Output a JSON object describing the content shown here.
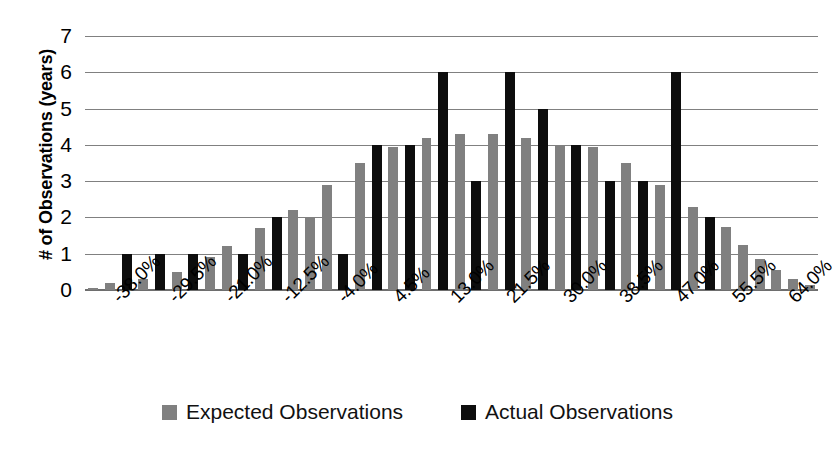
{
  "chart_data": {
    "type": "bar",
    "title": "",
    "subtitle": "",
    "xlabel": "",
    "ylabel": "# of Observations (years)",
    "ylim": [
      0,
      7
    ],
    "yticks": [
      7,
      6,
      5,
      4,
      3,
      2,
      1,
      0
    ],
    "grid": true,
    "legend_position": "bottom-center",
    "axis_tick_labels": [
      "-38.0%",
      "-29.5%",
      "-21.0%",
      "-12.5%",
      "-4.0%",
      "4.5%",
      "13.0%",
      "21.5%",
      "30.0%",
      "38.5%",
      "47.0%",
      "55.5%",
      "64.0%"
    ],
    "categories": [
      "-38.0%",
      "-35.0%",
      "-32.0%",
      "-29.5%",
      "-26.5%",
      "-24.0%",
      "-21.0%",
      "-18.0%",
      "-15.5%",
      "-12.5%",
      "-9.5%",
      "-7.0%",
      "-4.0%",
      "-1.0%",
      "1.5%",
      "4.5%",
      "7.5%",
      "10.0%",
      "13.0%",
      "16.0%",
      "18.5%",
      "21.5%",
      "24.5%",
      "27.0%",
      "30.0%",
      "33.0%",
      "35.5%",
      "38.5%",
      "41.5%",
      "44.0%",
      "47.0%",
      "50.0%",
      "52.5%",
      "55.5%",
      "58.5%",
      "61.0%",
      "64.0%"
    ],
    "series": [
      {
        "name": "Expected Observations",
        "color": "#808080",
        "values": [
          0.05,
          0.2,
          0.3,
          0.5,
          0.9,
          0.9,
          0.9,
          1.2,
          1.7,
          2.2,
          2.9,
          3.5,
          3.95,
          4.2,
          4.3,
          4.2,
          4.0,
          3.95,
          3.5,
          2.9,
          2.3,
          1.75,
          1.25,
          0.85,
          0.55,
          0.3,
          0.15,
          0.05,
          0,
          0,
          0,
          0,
          0,
          0,
          0,
          0,
          0
        ]
      },
      {
        "name": "Actual Observations",
        "color": "#0d0d0d",
        "values": [
          0,
          1,
          1,
          1,
          0,
          0,
          0,
          1,
          2,
          1,
          4,
          4,
          6,
          2,
          6,
          4,
          5,
          4,
          3,
          3,
          6,
          2,
          0,
          0,
          0,
          0,
          0,
          0,
          0,
          0,
          0,
          0,
          0,
          0,
          0,
          0,
          0
        ]
      }
    ],
    "bars": [
      {
        "expected": 0.05,
        "actual": 0
      },
      {
        "expected": 0.2,
        "actual": 0
      },
      {
        "expected": 0,
        "actual": 1
      },
      {
        "expected": 0.3,
        "actual": 0
      },
      {
        "expected": 0,
        "actual": 1
      },
      {
        "expected": 0.5,
        "actual": 0
      },
      {
        "expected": 0,
        "actual": 1
      },
      {
        "expected": 0.9,
        "actual": 0
      },
      {
        "expected": 1.2,
        "actual": 0
      },
      {
        "expected": 0,
        "actual": 1
      },
      {
        "expected": 1.7,
        "actual": 0
      },
      {
        "expected": 0,
        "actual": 2
      },
      {
        "expected": 2.2,
        "actual": 0
      },
      {
        "expected": 2.0,
        "actual": 0
      },
      {
        "expected": 2.9,
        "actual": 0
      },
      {
        "expected": 0,
        "actual": 1
      },
      {
        "expected": 3.5,
        "actual": 0
      },
      {
        "expected": 0,
        "actual": 4
      },
      {
        "expected": 3.95,
        "actual": 0
      },
      {
        "expected": 0,
        "actual": 4
      },
      {
        "expected": 4.2,
        "actual": 0
      },
      {
        "expected": 0,
        "actual": 6
      },
      {
        "expected": 4.3,
        "actual": 0
      },
      {
        "expected": 0,
        "actual": 3
      },
      {
        "expected": 4.3,
        "actual": 0
      },
      {
        "expected": 0,
        "actual": 6
      },
      {
        "expected": 4.2,
        "actual": 0
      },
      {
        "expected": 0,
        "actual": 5
      },
      {
        "expected": 4.0,
        "actual": 0
      },
      {
        "expected": 0,
        "actual": 4
      },
      {
        "expected": 3.95,
        "actual": 0
      },
      {
        "expected": 0,
        "actual": 3
      },
      {
        "expected": 3.5,
        "actual": 0
      },
      {
        "expected": 0,
        "actual": 3
      },
      {
        "expected": 2.9,
        "actual": 0
      },
      {
        "expected": 0,
        "actual": 6
      },
      {
        "expected": 2.3,
        "actual": 0
      },
      {
        "expected": 0,
        "actual": 2
      },
      {
        "expected": 1.75,
        "actual": 0
      },
      {
        "expected": 1.25,
        "actual": 0
      },
      {
        "expected": 0.85,
        "actual": 0
      },
      {
        "expected": 0.55,
        "actual": 0
      },
      {
        "expected": 0.3,
        "actual": 0
      },
      {
        "expected": 0.15,
        "actual": 0
      }
    ],
    "legend": [
      {
        "label": "Expected Observations",
        "color": "#808080",
        "icon": "square-swatch-gray"
      },
      {
        "label": "Actual Observations",
        "color": "#0d0d0d",
        "icon": "square-swatch-black"
      }
    ]
  }
}
